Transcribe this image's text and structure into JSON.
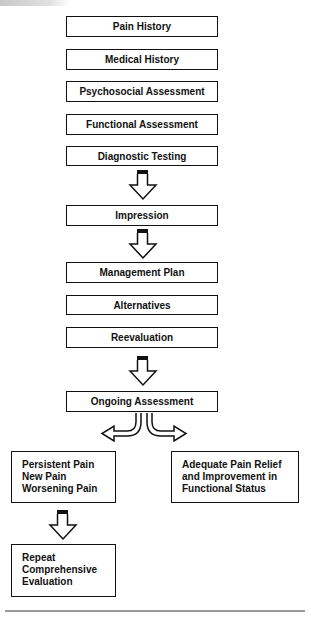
{
  "diagram": {
    "type": "flowchart",
    "title": "",
    "main_steps": [
      {
        "id": "pain-history",
        "label": "Pain History"
      },
      {
        "id": "medical-history",
        "label": "Medical History"
      },
      {
        "id": "psychosocial-assessment",
        "label": "Psychosocial Assessment"
      },
      {
        "id": "functional-assessment",
        "label": "Functional Assessment"
      },
      {
        "id": "diagnostic-testing",
        "label": "Diagnostic Testing"
      },
      {
        "id": "impression",
        "label": "Impression"
      },
      {
        "id": "management-plan",
        "label": "Management Plan"
      },
      {
        "id": "alternatives",
        "label": "Alternatives"
      },
      {
        "id": "reevaluation",
        "label": "Reevaluation"
      },
      {
        "id": "ongoing-assessment",
        "label": "Ongoing Assessment"
      }
    ],
    "branches": {
      "left": {
        "lines": [
          "Persistent Pain",
          "New Pain",
          "Worsening Pain"
        ]
      },
      "right": {
        "lines": [
          "Adequate Pain Relief",
          "and Improvement in",
          "Functional Status"
        ]
      }
    },
    "final": {
      "lines": [
        "Repeat",
        "Comprehensive",
        "Evaluation"
      ]
    },
    "edges": [
      {
        "from": "diagnostic-testing",
        "to": "impression"
      },
      {
        "from": "impression",
        "to": "management-plan"
      },
      {
        "from": "reevaluation",
        "to": "ongoing-assessment"
      },
      {
        "from": "ongoing-assessment",
        "to": "left-branch"
      },
      {
        "from": "ongoing-assessment",
        "to": "right-branch"
      },
      {
        "from": "left-branch",
        "to": "final"
      }
    ]
  },
  "colors": {
    "stroke": "#111111",
    "background": "#ffffff",
    "rule": "#9a9a9a"
  }
}
